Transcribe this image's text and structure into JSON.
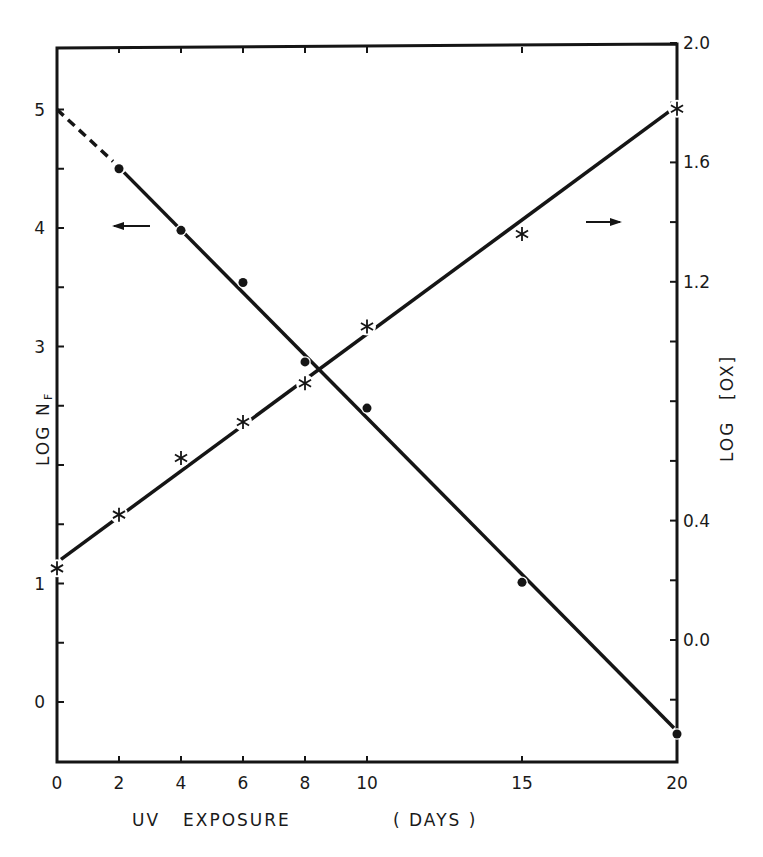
{
  "chart_data": {
    "type": "line",
    "title": "",
    "xlabel": "UV EXPOSURE  (DAYS)",
    "xlabel_parts": [
      "UV",
      "EXPOSURE",
      "( DAYS )"
    ],
    "ylabel_left": "LOG N_F",
    "ylabel_left_parts": {
      "main": "LOG",
      "symbol": "N",
      "subscript": "F"
    },
    "ylabel_right": "LOG [OX]",
    "ylabel_right_parts": {
      "main": "LOG",
      "bracketed": "[OX]"
    },
    "xlim": [
      0,
      20
    ],
    "ylim_left": [
      -0.5,
      5.5
    ],
    "ylim_right": [
      -0.4,
      2.0
    ],
    "grid": false,
    "x_ticks": [
      0,
      2,
      4,
      6,
      8,
      10,
      15,
      20
    ],
    "x_tick_labels": [
      "0",
      "2",
      "4",
      "6",
      "8",
      "10",
      "15",
      "20"
    ],
    "y_left_ticks": [
      0,
      0.5,
      1,
      1.5,
      2,
      2.5,
      3,
      3.5,
      4,
      4.5,
      5
    ],
    "y_left_tick_labels": [
      {
        "value": 0,
        "label": "0"
      },
      {
        "value": 1,
        "label": "1"
      },
      {
        "value": 3,
        "label": "3"
      },
      {
        "value": 4,
        "label": "4"
      },
      {
        "value": 5,
        "label": "5"
      }
    ],
    "y_right_ticks": [
      -0.2,
      0.0,
      0.2,
      0.4,
      0.6,
      0.8,
      1.0,
      1.2,
      1.4,
      1.6,
      1.8,
      2.0
    ],
    "y_right_tick_labels": [
      {
        "value": 0.0,
        "label": "0.0"
      },
      {
        "value": 0.4,
        "label": "0.4"
      },
      {
        "value": 1.2,
        "label": "1.2"
      },
      {
        "value": 1.6,
        "label": "1.6"
      },
      {
        "value": 2.0,
        "label": "2.0"
      }
    ],
    "series": [
      {
        "name": "LOG N_F",
        "axis": "left",
        "marker": "filled-circle",
        "x": [
          2,
          4,
          6,
          8,
          10,
          15,
          20
        ],
        "values": [
          4.5,
          3.98,
          3.54,
          2.87,
          2.48,
          1.01,
          -0.27
        ],
        "fit_line": {
          "dashed_from": [
            0,
            5.0
          ],
          "dashed_to": [
            2,
            4.52
          ],
          "solid_to": [
            20,
            -0.22
          ]
        },
        "indicator_arrow": "left"
      },
      {
        "name": "LOG [OX]",
        "axis": "right",
        "marker": "asterisk",
        "x": [
          0,
          2,
          4,
          6,
          8,
          10,
          15,
          20
        ],
        "values": [
          0.24,
          0.42,
          0.61,
          0.73,
          0.86,
          1.05,
          1.36,
          1.78
        ],
        "fit_line": {
          "from": [
            0,
            0.27
          ],
          "to": [
            20,
            1.77
          ]
        },
        "indicator_arrow": "right"
      }
    ],
    "legend": "none (arrows indicate axis for each series)"
  }
}
